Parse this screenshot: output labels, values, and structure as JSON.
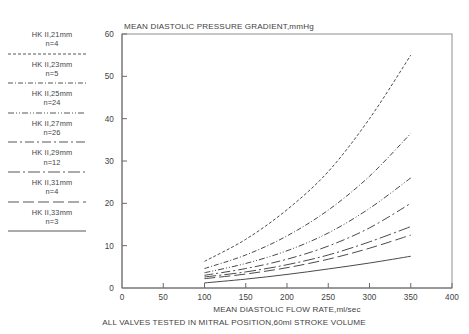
{
  "chart_data": {
    "type": "line",
    "title": "MEAN  DIASTOLIC  PRESSURE  GRADIENT,mmHg",
    "xlabel": "MEAN  DIASTOLIC  FLOW  RATE,ml/sec",
    "ylabel": "MEAN  DIASTOLIC  PRESSURE  GRADIENT,mmHg",
    "caption": "ALL  VALVES  TESTED  IN  MITRAL  POSITION,60ml  STROKE  VOLUME",
    "xlim": [
      0,
      400
    ],
    "ylim": [
      0,
      60
    ],
    "xticks": [
      0,
      50,
      100,
      150,
      200,
      250,
      300,
      350,
      400
    ],
    "yticks": [
      0,
      10,
      20,
      30,
      40,
      50,
      60
    ],
    "xtick_labels": [
      "0",
      "50",
      "100",
      "150",
      "200",
      "250",
      "300",
      "350",
      "400"
    ],
    "ytick_labels": [
      "0",
      "10",
      "20",
      "30",
      "40",
      "50",
      "60"
    ],
    "grid": false,
    "legend_position": "left-outside",
    "x": [
      100,
      150,
      200,
      250,
      300,
      350
    ],
    "series": [
      {
        "name": "HK  II,21mm",
        "label_line1": "HK  II,21mm",
        "label_line2": "n=4",
        "n": 4,
        "size_mm": 21,
        "dash": "3,2",
        "values": [
          6.3,
          11.5,
          18.5,
          27.5,
          40.0,
          55.0
        ]
      },
      {
        "name": "HK  II,23mm",
        "label_line1": "HK  II,23mm",
        "label_line2": "n=5",
        "n": 5,
        "size_mm": 23,
        "dash": "5,2,1,2",
        "values": [
          4.6,
          7.8,
          12.3,
          18.4,
          26.4,
          36.5
        ]
      },
      {
        "name": "HK  II,25mm",
        "label_line1": "HK  II,25mm",
        "label_line2": "n=24",
        "n": 24,
        "size_mm": 25,
        "dash": "6,2,1,2,1,2",
        "values": [
          3.6,
          5.8,
          8.8,
          13.0,
          18.8,
          26.0
        ]
      },
      {
        "name": "HK  II,27mm",
        "label_line1": "HK  II,27mm",
        "label_line2": "n=26",
        "n": 26,
        "size_mm": 27,
        "dash": "9,3,2,3",
        "values": [
          3.0,
          4.6,
          6.8,
          9.9,
          14.2,
          20.0
        ]
      },
      {
        "name": "HK  II,29mm",
        "label_line1": "HK  II,29mm",
        "label_line2": "n=12",
        "n": 12,
        "size_mm": 29,
        "dash": "12,3,2,3",
        "values": [
          2.6,
          3.8,
          5.5,
          7.8,
          10.9,
          14.5
        ]
      },
      {
        "name": "HK  II,31mm",
        "label_line1": "HK  II,31mm",
        "label_line2": "n=4",
        "n": 4,
        "size_mm": 31,
        "dash": "11,4",
        "values": [
          2.2,
          3.3,
          4.8,
          6.8,
          9.4,
          12.5
        ]
      },
      {
        "name": "HK  II,33mm",
        "label_line1": "HK  II,33mm",
        "label_line2": "n=3",
        "n": 3,
        "size_mm": 33,
        "dash": "none",
        "values": [
          1.2,
          2.1,
          3.2,
          4.5,
          5.9,
          7.5
        ]
      }
    ]
  }
}
